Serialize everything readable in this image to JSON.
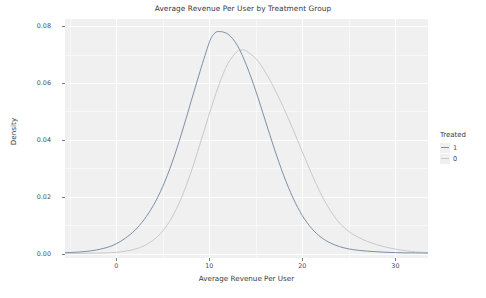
{
  "chart_data": {
    "type": "line",
    "title": "Average Revenue Per User by Treatment Group",
    "xlabel": "Average Revenue Per User",
    "ylabel": "Density",
    "xlim": [
      -5.5,
      33.5
    ],
    "ylim": [
      -0.0015,
      0.0825
    ],
    "xticks": [
      0,
      10,
      20,
      30
    ],
    "xtick_labels": [
      "0",
      "10",
      "20",
      "30"
    ],
    "yticks": [
      0.0,
      0.02,
      0.04,
      0.06,
      0.08
    ],
    "ytick_labels": [
      "0.00",
      "0.02",
      "0.04",
      "0.06",
      "0.08"
    ],
    "grid": true,
    "legend_position": "right",
    "legend_title": "Treated",
    "series": [
      {
        "name": "1",
        "label": "1",
        "color": "#7d8fa8",
        "peak_x": 10.5,
        "peak_y": 0.0781,
        "x": [
          -5.5,
          -4,
          -2.5,
          -1,
          0,
          1,
          2,
          3,
          4,
          5,
          6,
          7,
          8,
          9,
          10,
          10.5,
          11,
          12,
          13,
          14,
          15,
          16,
          17,
          18,
          19,
          20,
          21,
          22,
          23,
          24,
          25,
          26,
          27,
          28,
          29,
          30,
          31,
          32,
          33.5
        ],
        "y": [
          0.0004,
          0.0006,
          0.0011,
          0.0022,
          0.0035,
          0.0055,
          0.0082,
          0.012,
          0.017,
          0.0236,
          0.032,
          0.042,
          0.053,
          0.064,
          0.0742,
          0.0772,
          0.0781,
          0.0772,
          0.0733,
          0.0662,
          0.0572,
          0.047,
          0.0368,
          0.0275,
          0.0196,
          0.0134,
          0.0089,
          0.0058,
          0.0038,
          0.0025,
          0.0017,
          0.0012,
          0.0009,
          0.0007,
          0.0005,
          0.0004,
          0.0003,
          0.0003,
          0.0002
        ]
      },
      {
        "name": "0",
        "label": "0",
        "color": "#c9c9cc",
        "peak_x": 13.6,
        "peak_y": 0.0716,
        "x": [
          -5.5,
          -4,
          -2.5,
          -1,
          0,
          1,
          2,
          3,
          4,
          5,
          6,
          7,
          8,
          9,
          10,
          11,
          12,
          13,
          13.6,
          14,
          15,
          16,
          17,
          18,
          19,
          20,
          21,
          22,
          23,
          24,
          25,
          26,
          27,
          28,
          29,
          30,
          31,
          32,
          33.5
        ],
        "y": [
          0.0001,
          0.0001,
          0.0002,
          0.0003,
          0.0005,
          0.0009,
          0.0016,
          0.0028,
          0.0048,
          0.008,
          0.0128,
          0.0196,
          0.0283,
          0.0385,
          0.0491,
          0.059,
          0.0668,
          0.0711,
          0.0716,
          0.0712,
          0.0686,
          0.064,
          0.058,
          0.0512,
          0.0437,
          0.0358,
          0.0281,
          0.021,
          0.0152,
          0.0108,
          0.0078,
          0.0058,
          0.0043,
          0.0032,
          0.0023,
          0.0016,
          0.0011,
          0.0007,
          0.0004
        ]
      }
    ]
  },
  "legend": {
    "title": "Treated",
    "items": [
      {
        "label": "1"
      },
      {
        "label": "0"
      }
    ]
  },
  "colors": {
    "panel_background": "#f0f0f0",
    "gridline": "#ffffff",
    "text": "#4d4d4d",
    "series_1": "#7d8fa8",
    "series_0": "#c9c9cc"
  }
}
